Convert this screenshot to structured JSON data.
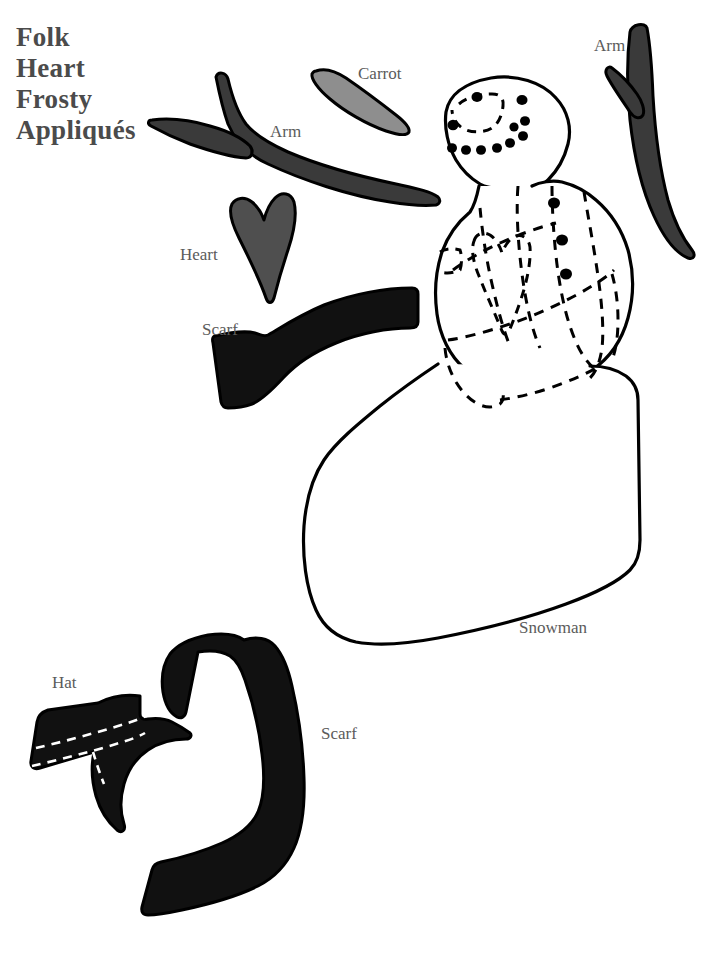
{
  "page": {
    "width": 709,
    "height": 964,
    "background": "#ffffff"
  },
  "title": {
    "line1": "Folk",
    "line2": "Heart",
    "line3": "Frosty",
    "line4": "Appliqués",
    "color": "#4b4b4b"
  },
  "labels": {
    "arm_left": "Arm",
    "arm_right": "Arm",
    "carrot": "Carrot",
    "heart": "Heart",
    "scarf_top": "Scarf",
    "snowman": "Snowman",
    "hat": "Hat",
    "scarf_bottom": "Scarf",
    "color": "#5b5b5b"
  },
  "colors": {
    "outline": "#000000",
    "black_piece": "#111111",
    "dark_charcoal": "#3a3a3a",
    "medium_gray": "#4f4f4f",
    "light_gray": "#8e8e8e",
    "paper": "#ffffff"
  },
  "pieces": [
    {
      "name": "arm-left",
      "label": "Arm",
      "fill": "#3a3a3a",
      "shape": "branched-stick"
    },
    {
      "name": "arm-right",
      "label": "Arm",
      "fill": "#3a3a3a",
      "shape": "branched-stick"
    },
    {
      "name": "carrot",
      "label": "Carrot",
      "fill": "#8e8e8e",
      "shape": "tapered-cone"
    },
    {
      "name": "heart",
      "label": "Heart",
      "fill": "#4f4f4f",
      "shape": "folk-heart"
    },
    {
      "name": "scarf-top",
      "label": "Scarf",
      "fill": "#111111",
      "shape": "wave-band"
    },
    {
      "name": "scarf-bottom",
      "label": "Scarf",
      "fill": "#111111",
      "shape": "hooked-band"
    },
    {
      "name": "hat",
      "label": "Hat",
      "fill": "#111111",
      "shape": "crescent-hat"
    },
    {
      "name": "snowman",
      "label": "Snowman",
      "fill": "#ffffff",
      "shape": "body-outline"
    }
  ],
  "snowman_details": {
    "face_dots": 12,
    "buttons": 3,
    "has_dashed_heart_applique": true,
    "has_dashed_scarf_lines": true,
    "has_dashed_hat_placement": true
  }
}
